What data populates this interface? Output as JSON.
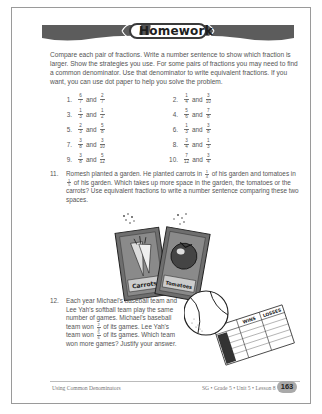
{
  "banner": {
    "title": "Homework",
    "icon": "book-icon"
  },
  "intro": "Compare each pair of fractions. Write a number sentence to show which fraction is larger. Show the strategies you use. For some pairs of fractions you may need to find a common denominator. Use that denominator to write equivalent fractions. If you want, you can use dot paper to help you solve the problem.",
  "and_label": "and",
  "problems": [
    {
      "num": "1.",
      "a": {
        "n": "6",
        "d": "7"
      },
      "b": {
        "n": "2",
        "d": "7"
      }
    },
    {
      "num": "2.",
      "a": {
        "n": "1",
        "d": "4"
      },
      "b": {
        "n": "3",
        "d": "10"
      }
    },
    {
      "num": "3.",
      "a": {
        "n": "1",
        "d": "3"
      },
      "b": {
        "n": "1",
        "d": "2"
      }
    },
    {
      "num": "4.",
      "a": {
        "n": "5",
        "d": "6"
      },
      "b": {
        "n": "7",
        "d": "8"
      }
    },
    {
      "num": "5.",
      "a": {
        "n": "2",
        "d": "3"
      },
      "b": {
        "n": "5",
        "d": "8"
      }
    },
    {
      "num": "6.",
      "a": {
        "n": "1",
        "d": "3"
      },
      "b": {
        "n": "3",
        "d": "8"
      }
    },
    {
      "num": "7.",
      "a": {
        "n": "3",
        "d": "8"
      },
      "b": {
        "n": "3",
        "d": "10"
      }
    },
    {
      "num": "8.",
      "a": {
        "n": "3",
        "d": "4"
      },
      "b": {
        "n": "1",
        "d": "3"
      }
    },
    {
      "num": "9.",
      "a": {
        "n": "3",
        "d": "8"
      },
      "b": {
        "n": "5",
        "d": "12"
      }
    },
    {
      "num": "10.",
      "a": {
        "n": "7",
        "d": "12"
      },
      "b": {
        "n": "3",
        "d": "4"
      }
    }
  ],
  "problem11": {
    "num": "11.",
    "t1": "Romesh planted a garden. He planted carrots in",
    "f1": {
      "n": "1",
      "d": "4"
    },
    "t2": "of his garden and tomatoes in",
    "f2": {
      "n": "1",
      "d": "5"
    },
    "t3": "of his garden. Which takes up more space in the garden, the tomatoes or the carrots? Use equivalent fractions to write a number sentence comparing these two spaces."
  },
  "seed_packets": {
    "left": "Carrots",
    "right": "Tomatoes"
  },
  "problem12": {
    "num": "12.",
    "t1": "Each year Michael's baseball team and Lee Yah's softball team play the same number of games. Michael's baseball team won",
    "f1": {
      "n": "2",
      "d": "3"
    },
    "t2": "of its games. Lee Yah's team won",
    "f2": {
      "n": "5",
      "d": "6"
    },
    "t3": "of its games. Which team won more games? Justify your answer."
  },
  "scorecard": {
    "col1": "WINS",
    "col2": "LOSSES"
  },
  "footer": {
    "left": "Using Common Denominators",
    "right": "SG • Grade 5 • Unit 5 • Lesson 8",
    "page": "163"
  }
}
